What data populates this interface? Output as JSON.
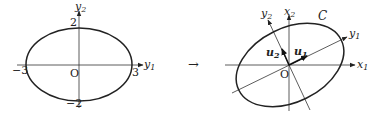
{
  "left_diagram": {
    "origin_label": "O",
    "axis_h": {
      "name": "y",
      "sub": "1"
    },
    "axis_v": {
      "name": "y",
      "sub": "2"
    },
    "ticks": {
      "neg_x": "−3",
      "pos_x": "3",
      "pos_y": "2",
      "neg_y": "−2"
    },
    "ellipse": {
      "semi_axis_h": 3,
      "semi_axis_v": 2
    }
  },
  "transform_arrow": "→",
  "right_diagram": {
    "origin_label": "O",
    "curve_label": "C",
    "axis_x1": {
      "name": "x",
      "sub": "1"
    },
    "axis_x2": {
      "name": "x",
      "sub": "2"
    },
    "axis_y1": {
      "name": "y",
      "sub": "1"
    },
    "axis_y2": {
      "name": "y",
      "sub": "2"
    },
    "vec_u1": {
      "name": "u",
      "sub": "1"
    },
    "vec_u2": {
      "name": "u",
      "sub": "2"
    }
  }
}
